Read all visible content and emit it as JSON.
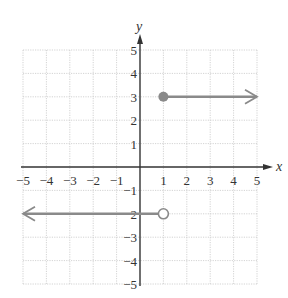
{
  "chart_data": {
    "type": "line",
    "title": "",
    "xlabel": "x",
    "ylabel": "y",
    "xlim": [
      -5,
      5
    ],
    "ylim": [
      -5,
      5
    ],
    "grid": true,
    "x_ticks": [
      "-5",
      "-4",
      "-3",
      "-2",
      "-1",
      "1",
      "2",
      "3",
      "4",
      "5"
    ],
    "y_ticks": [
      "5",
      "4",
      "3",
      "2",
      "1",
      "-1",
      "-2",
      "-3",
      "-4",
      "-5"
    ],
    "series": [
      {
        "name": "upper-ray",
        "description": "y = 3 for x >= 1",
        "y": 3,
        "start_x": 1,
        "start_point": "closed",
        "direction": "right",
        "end_x": 5
      },
      {
        "name": "lower-ray",
        "description": "y = -2 for x < 1",
        "y": -2,
        "start_x": 1,
        "start_point": "open",
        "direction": "left",
        "end_x": -5
      }
    ],
    "colors": {
      "ray": "#8a8a8a",
      "axis": "#333333",
      "grid": "#c8c8c8"
    }
  }
}
